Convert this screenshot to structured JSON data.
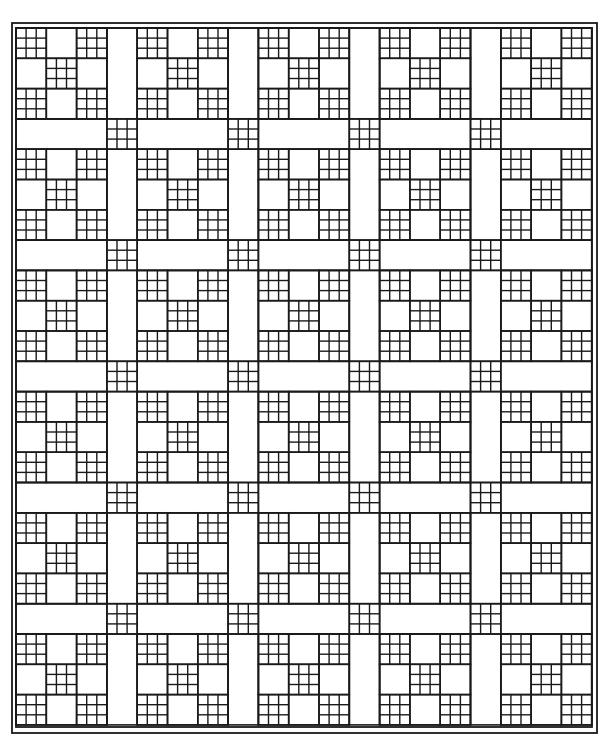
{
  "colors": {
    "line": "#1a1a1a",
    "fill": "#ffffff"
  },
  "layout": {
    "origin_x": 16,
    "origin_y": 28,
    "unit": 30.3,
    "blocks_across": 5,
    "blocks_down": 6,
    "block_units": 3,
    "sashing_units": 1,
    "outer_border": {
      "x": 12,
      "y": 23,
      "w": 585,
      "h": 710
    },
    "inner_border": {
      "x": 16,
      "y": 28,
      "w": 576,
      "h": 699
    }
  },
  "block": {
    "name": "nine-patch block",
    "ninepatch_cells": [
      [
        0,
        0
      ],
      [
        2,
        0
      ],
      [
        1,
        1
      ],
      [
        0,
        2
      ],
      [
        2,
        2
      ]
    ],
    "plain_cells": [
      [
        1,
        0
      ],
      [
        0,
        1
      ],
      [
        2,
        1
      ],
      [
        1,
        2
      ]
    ],
    "ninepatch_grid": 3
  },
  "sashing": {
    "cornerstone": "nine-patch",
    "strip": "plain"
  }
}
